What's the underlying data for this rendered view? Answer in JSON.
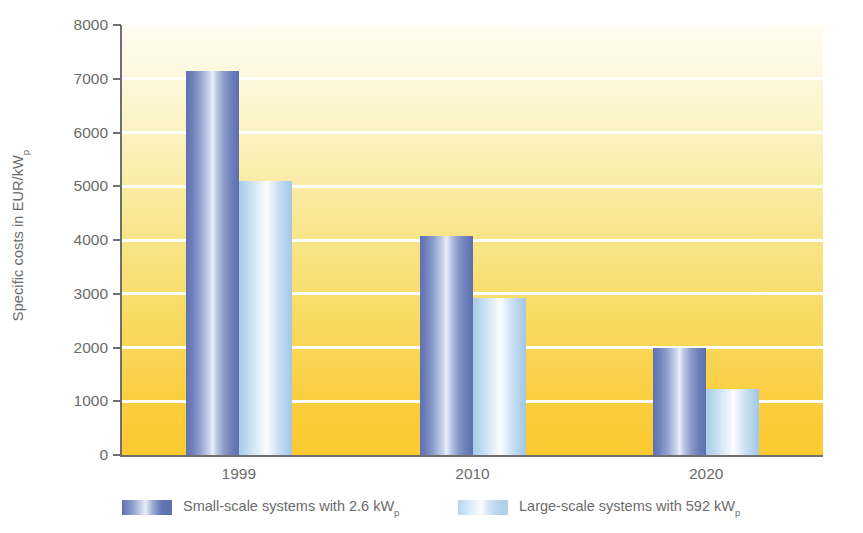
{
  "chart_data": {
    "type": "bar",
    "title": "",
    "xlabel": "",
    "ylabel": "Specific costs in EUR/kW",
    "ylabel_subscript": "p",
    "categories": [
      "1999",
      "2010",
      "2020"
    ],
    "series": [
      {
        "name": "Small-scale systems with 2.6 kW",
        "name_subscript": "p",
        "color": "#6375b2",
        "values": [
          7150,
          4080,
          2000
        ]
      },
      {
        "name": "Large-scale systems with 592 kW",
        "name_subscript": "p",
        "color": "#bcdaf0",
        "values": [
          5100,
          2930,
          1230
        ]
      }
    ],
    "ylim": [
      0,
      8000
    ],
    "yticks": [
      0,
      1000,
      2000,
      3000,
      4000,
      5000,
      6000,
      7000,
      8000
    ],
    "ytick_labels": [
      "0",
      "1000",
      "2000",
      "3000",
      "4000",
      "5000",
      "6000",
      "7000",
      "8000"
    ],
    "grid": true,
    "gridline_color": "#ffffff",
    "legend_position": "bottom",
    "axis_color": "#6f6f6f",
    "text_color": "#6b6b6b",
    "plot_background_top": "#fffdf2",
    "plot_background_bottom": "#fcc92f"
  }
}
